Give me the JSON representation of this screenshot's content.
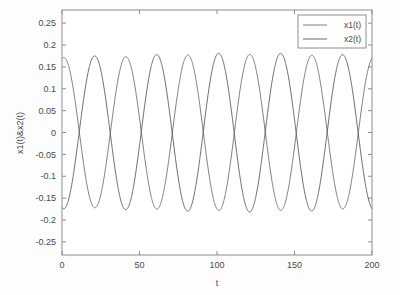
{
  "chart_data": {
    "type": "line",
    "title": "",
    "xlabel": "t",
    "ylabel": "x1(t)&x2(t)",
    "xlim": [
      0,
      200
    ],
    "ylim": [
      -0.28,
      0.28
    ],
    "xticks": [
      0,
      50,
      100,
      150,
      200
    ],
    "xtick_labels": [
      "0",
      "50",
      "100",
      "150",
      "200"
    ],
    "yticks": [
      0.25,
      0.2,
      0.15,
      0.1,
      0.05,
      0,
      -0.05,
      -0.1,
      -0.15,
      -0.2,
      -0.25
    ],
    "ytick_labels": [
      "0.25",
      "0.2",
      "0.15",
      "0.1",
      "0.05",
      "0",
      "-0.05",
      "-0.1",
      "-0.15",
      "-0.2",
      "-0.25"
    ],
    "grid": false,
    "legend_position": "upper-right",
    "series": [
      {
        "name": "x1(t)",
        "color": "#6f6f6f",
        "amplitude": 0.175,
        "angular_frequency": 0.1571,
        "phase": 1.38,
        "offset": 0.0,
        "beat_frequency": 0.0042,
        "beat_depth": 0.02,
        "start_value": 0.168,
        "end_value": 0.155
      },
      {
        "name": "x2(t)",
        "color": "#5a5a5a",
        "amplitude": 0.178,
        "angular_frequency": 0.1571,
        "phase": -1.74,
        "offset": 0.0,
        "beat_frequency": 0.0042,
        "beat_depth": 0.02,
        "start_value": -0.028,
        "end_value": -0.082
      }
    ],
    "series_names": [
      "x1(t)",
      "x2(t)"
    ],
    "num_points": 1200,
    "peak_value": 0.18,
    "trough_value": -0.18,
    "cycles_visible": 5
  },
  "legend": {
    "entries": [
      {
        "label": "x1(t)"
      },
      {
        "label": "x2(t)"
      }
    ]
  },
  "axes": {
    "x_title": "t",
    "y_title": "x1(t)&x2(t)"
  }
}
